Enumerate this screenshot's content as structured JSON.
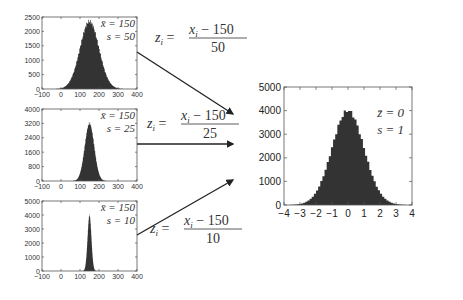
{
  "chart_data": [
    {
      "type": "bar",
      "title": "",
      "annotation": [
        "x̄ = 150",
        "s = 50"
      ],
      "xlim": [
        -100,
        400
      ],
      "xticks": [
        "−100",
        "0",
        "100",
        "200",
        "300",
        "400"
      ],
      "ylim": [
        0,
        2500
      ],
      "yticks": [
        "0",
        "500",
        "1000",
        "1500",
        "2000",
        "2500"
      ],
      "mean": 150,
      "sd": 50,
      "peak": 2350
    },
    {
      "type": "bar",
      "title": "",
      "annotation": [
        "x̄ = 150",
        "s = 25"
      ],
      "xlim": [
        -100,
        400
      ],
      "xticks": [
        "−100",
        "0",
        "100",
        "200",
        "300",
        "400"
      ],
      "ylim": [
        0,
        4000
      ],
      "yticks": [
        "0",
        "800",
        "1600",
        "2400",
        "3200",
        "4000"
      ],
      "mean": 150,
      "sd": 25,
      "peak": 3200
    },
    {
      "type": "bar",
      "title": "",
      "annotation": [
        "x̄ = 150",
        "s = 10"
      ],
      "xlim": [
        -100,
        400
      ],
      "xticks": [
        "−100",
        "0",
        "100",
        "200",
        "300",
        "400"
      ],
      "ylim": [
        0,
        5000
      ],
      "yticks": [
        "0",
        "1000",
        "2000",
        "3000",
        "4000",
        "5000"
      ],
      "mean": 150,
      "sd": 10,
      "peak": 4000
    },
    {
      "type": "bar",
      "title": "",
      "annotation": [
        "z̄ = 0",
        "s = 1"
      ],
      "xlim": [
        -4,
        4
      ],
      "xticks": [
        "−4",
        "−3",
        "−2",
        "−1",
        "0",
        "1",
        "2",
        "3",
        "4"
      ],
      "ylim": [
        0,
        5000
      ],
      "yticks": [
        "0",
        "1000",
        "2000",
        "3000",
        "4000",
        "5000"
      ],
      "mean": 0,
      "sd": 1,
      "peak": 4000
    }
  ],
  "equations": [
    {
      "lhs": "z",
      "sub": "i",
      "num": "x",
      "num_sub": "i",
      "num_rest": " − 150",
      "den": "50"
    },
    {
      "lhs": "z",
      "sub": "i",
      "num": "x",
      "num_sub": "i",
      "num_rest": " − 150",
      "den": "25"
    },
    {
      "lhs": "z",
      "sub": "i",
      "num": "x",
      "num_sub": "i",
      "num_rest": " − 150",
      "den": "10"
    }
  ],
  "colors": {
    "bars": "#333333",
    "axes": "#555555",
    "arrow": "#222222"
  }
}
